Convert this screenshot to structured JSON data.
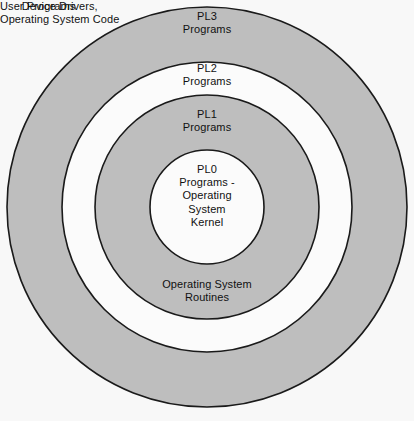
{
  "diagram": {
    "type": "concentric-rings",
    "title_present": false,
    "background_color": "#f8f8f8",
    "ring_fill_gray": "#bebebe",
    "ring_fill_white": "#fbfbfb",
    "ring_stroke_color": "#1a1a1a",
    "center": {
      "x": 207,
      "y": 207
    },
    "rings": [
      {
        "name": "outer-ring-pl3",
        "radius": 200,
        "fill": "#bebebe",
        "labels": [
          "PL3 Programs",
          "User Programs"
        ]
      },
      {
        "name": "ring-pl2",
        "radius": 145,
        "fill": "#fbfbfb",
        "labels": [
          "PL2 Programs",
          "Device Drivers, Operating System Code"
        ]
      },
      {
        "name": "ring-pl1",
        "radius": 112,
        "fill": "#bebebe",
        "labels": [
          "PL1 Programs",
          "Operating System Routines"
        ]
      },
      {
        "name": "core-pl0",
        "radius": 57,
        "fill": "#fbfbfb",
        "labels": [
          "PL0 Programs - Operating System Kernel"
        ]
      }
    ],
    "labels": {
      "pl3": "PL3\nPrograms",
      "pl2": "PL2\nPrograms",
      "pl1": "PL1\nPrograms",
      "pl0": "PL0\nPrograms -\nOperating\nSystem\nKernel",
      "os_routines": "Operating System\nRoutines",
      "device_drivers": "Device Drivers,\nOperating System Code",
      "user_programs": "User Programs"
    }
  }
}
